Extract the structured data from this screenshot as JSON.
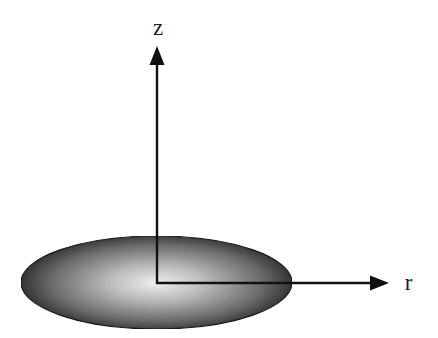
{
  "diagram": {
    "axes": {
      "z": {
        "label": "z",
        "direction": "up"
      },
      "r": {
        "label": "r",
        "direction": "right"
      }
    },
    "disk": {
      "shape": "ellipse",
      "fill": "radial gradient, light center to dark edge",
      "center_color": "#f4f4f4",
      "edge_color": "#2e2e2e",
      "outline_color": "#1a1a1a"
    },
    "colors": {
      "background": "#ffffff",
      "axis": "#111111",
      "label": "#1a1a1a"
    }
  }
}
